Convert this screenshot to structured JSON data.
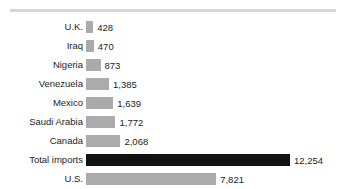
{
  "chart_data": {
    "type": "bar",
    "orientation": "horizontal",
    "title": "",
    "subtitle": "",
    "xlabel": "",
    "ylabel": "",
    "grid": false,
    "legend": false,
    "xlim": [
      0,
      12254
    ],
    "categories": [
      "U.K.",
      "Iraq",
      "Nigeria",
      "Venezuela",
      "Mexico",
      "Saudi Arabia",
      "Canada",
      "Total imports",
      "U.S."
    ],
    "values": [
      428,
      470,
      873,
      1385,
      1639,
      1772,
      2068,
      12254,
      7821
    ],
    "value_labels": [
      "428",
      "470",
      "873",
      "1,385",
      "1,639",
      "1,772",
      "2,068",
      "12,254",
      "7,821"
    ],
    "highlight_category": "Total imports",
    "colors": {
      "bar": "#ababab",
      "highlight_bar": "#111111",
      "text": "#1c1c1c",
      "rule": "#d6d6d6",
      "background": "#ffffff"
    }
  },
  "rows": [
    {
      "label": "U.K.",
      "value": 428,
      "value_label": "428",
      "highlight": false
    },
    {
      "label": "Iraq",
      "value": 470,
      "value_label": "470",
      "highlight": false
    },
    {
      "label": "Nigeria",
      "value": 873,
      "value_label": "873",
      "highlight": false
    },
    {
      "label": "Venezuela",
      "value": 1385,
      "value_label": "1,385",
      "highlight": false
    },
    {
      "label": "Mexico",
      "value": 1639,
      "value_label": "1,639",
      "highlight": false
    },
    {
      "label": "Saudi Arabia",
      "value": 1772,
      "value_label": "1,772",
      "highlight": false
    },
    {
      "label": "Canada",
      "value": 2068,
      "value_label": "2,068",
      "highlight": false
    },
    {
      "label": "Total imports",
      "value": 12254,
      "value_label": "12,254",
      "highlight": true
    },
    {
      "label": "U.S.",
      "value": 7821,
      "value_label": "7,821",
      "highlight": false
    }
  ]
}
